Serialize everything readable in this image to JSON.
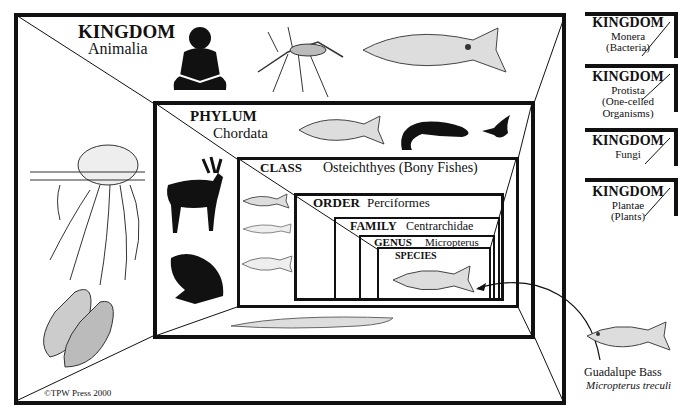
{
  "diagram": {
    "levels": [
      {
        "rank": "KINGDOM",
        "name": "Animalia"
      },
      {
        "rank": "PHYLUM",
        "name": "Chordata"
      },
      {
        "rank": "CLASS",
        "name": "Osteichthyes (Bony Fishes)"
      },
      {
        "rank": "ORDER",
        "name": "Perciformes"
      },
      {
        "rank": "FAMILY",
        "name": "Centrarchidae"
      },
      {
        "rank": "GENUS",
        "name": "Micropterus"
      },
      {
        "rank": "SPECIES",
        "name": ""
      }
    ],
    "other_kingdoms": [
      {
        "rank": "KINGDOM",
        "name": "Monera",
        "sub": "(Bacteria)"
      },
      {
        "rank": "KINGDOM",
        "name": "Protista",
        "sub": "(One-celled Organisms)"
      },
      {
        "rank": "KINGDOM",
        "name": "Fungi",
        "sub": ""
      },
      {
        "rank": "KINGDOM",
        "name": "Plantae",
        "sub": "(Plants)"
      }
    ],
    "featured_species": {
      "common": "Guadalupe Bass",
      "scientific": "Micropterus treculi"
    },
    "copyright": "©TPW Press 2000",
    "illustrations": {
      "kingdom": [
        "human-silhouette",
        "mosquito",
        "bass",
        "jellyfish",
        "mussel-shells"
      ],
      "phylum": [
        "bass",
        "lizard",
        "hummingbird",
        "deer",
        "frog",
        "lancelet"
      ],
      "class": [
        "bass",
        "eel-fish",
        "coelacanth"
      ],
      "species": [
        "guadalupe-bass"
      ]
    }
  }
}
